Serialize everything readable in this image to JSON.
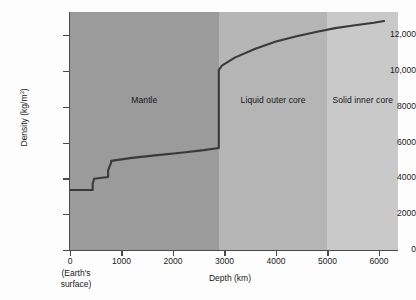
{
  "chart_data": {
    "type": "line",
    "title": "",
    "xlabel": "Depth (km)",
    "ylabel": "Density (kg/m³)",
    "xlim": [
      0,
      6370
    ],
    "ylim": [
      0,
      13300
    ],
    "grid": false,
    "legend": "none",
    "x_ticks": [
      0,
      1000,
      2000,
      3000,
      4000,
      5000,
      6000
    ],
    "x_tick_labels": [
      "0",
      "1000",
      "2000",
      "3000",
      "4000",
      "5000",
      "6000"
    ],
    "y_ticks": [
      0,
      2000,
      4000,
      6000,
      8000,
      10000,
      12000
    ],
    "y_tick_labels": [
      "0",
      "2000",
      "4000",
      "6000",
      "8000",
      "10,000",
      "12,000"
    ],
    "origin_annotation": "(Earth's\nsurface)",
    "origin_annotation_line1": "(Earth's",
    "origin_annotation_line2": "surface)",
    "series": [
      {
        "name": "Density vs depth",
        "color": "#3a3a3a",
        "x": [
          0,
          440,
          440,
          470,
          470,
          740,
          740,
          800,
          800,
          1200,
          1700,
          2200,
          2600,
          2890,
          2890,
          2950,
          3200,
          3600,
          4000,
          4400,
          4800,
          5150,
          5500,
          5900,
          6100
        ],
        "y": [
          3350,
          3350,
          3700,
          3980,
          3980,
          4080,
          4450,
          4900,
          4980,
          5150,
          5300,
          5450,
          5580,
          5700,
          10050,
          10300,
          10750,
          11250,
          11650,
          11950,
          12200,
          12400,
          12550,
          12700,
          12800
        ]
      }
    ],
    "regions": [
      {
        "name": "Mantle",
        "label": "Mantle",
        "x_start": 0,
        "x_end": 2890,
        "color": "#9b9b9b"
      },
      {
        "name": "Liquid outer core",
        "label": "Liquid outer core",
        "x_start": 2890,
        "x_end": 5000,
        "color": "#b5b5b5"
      },
      {
        "name": "Solid inner core",
        "label": "Solid inner core",
        "x_start": 5000,
        "x_end": 6370,
        "color": "#c9c9c9"
      }
    ],
    "key_values": {
      "surface_density": 3350,
      "base_of_mantle_density": 5700,
      "top_of_outer_core_density": 10050,
      "center_density": 12800,
      "mantle_outer_core_boundary_km": 2890,
      "outer_inner_core_boundary_km": 5000
    }
  }
}
